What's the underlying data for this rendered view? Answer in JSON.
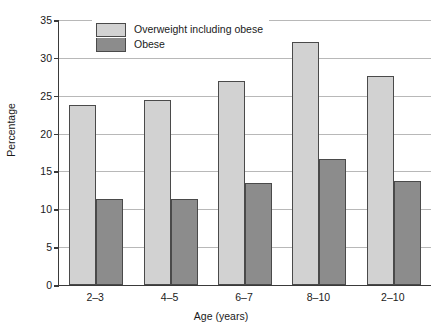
{
  "chart_data": {
    "type": "bar",
    "title": "",
    "subtitle": "",
    "xlabel": "Age (years)",
    "ylabel": "Percentage",
    "categories": [
      "2–3",
      "4–5",
      "6–7",
      "8–10",
      "2–10"
    ],
    "series": [
      {
        "name": "Overweight including obese",
        "color": "#d2d2d2",
        "values": [
          23.8,
          24.5,
          27.0,
          32.1,
          27.6
        ]
      },
      {
        "name": "Obese",
        "color": "#8c8c8c",
        "values": [
          11.3,
          11.3,
          13.5,
          16.7,
          13.8
        ]
      }
    ],
    "ylim": [
      0,
      35
    ],
    "yticks": [
      0,
      5,
      10,
      15,
      20,
      25,
      30,
      35
    ],
    "ytick_labels": [
      "0",
      "5",
      "10",
      "15",
      "20",
      "25",
      "30",
      "35"
    ],
    "grid": true,
    "grid_axis": "y",
    "legend_position": "top-left-inside",
    "axis_color": "#3a3a3a",
    "grid_color": "#b8b8b8",
    "background": "#ffffff"
  }
}
